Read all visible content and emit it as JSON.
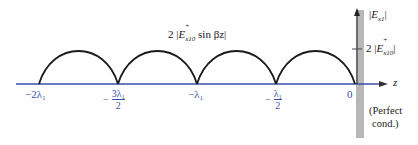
{
  "diagram": {
    "type": "standing-wave-field-magnitude",
    "curve_label": {
      "prefix": "2 |",
      "symbol": "E",
      "sub": "x10",
      "sup": "+",
      "suffix": " sin βz|"
    },
    "y_axis": {
      "label_prefix": "|",
      "symbol": "E",
      "sub": "x1",
      "label_suffix": "|",
      "tick_label": {
        "prefix": "2 |",
        "symbol": "E",
        "sub": "x10",
        "sup": "+",
        "suffix": "|"
      }
    },
    "x_axis": {
      "label": "z",
      "ticks": [
        {
          "label": "−2λ₁",
          "position": -1.0
        },
        {
          "minus": "−",
          "num": "3λ₁",
          "den": "2",
          "position": -0.75
        },
        {
          "label": "−λ₁",
          "position": -0.5
        },
        {
          "minus": "−",
          "num": "λ₁",
          "den": "2",
          "position": -0.25
        },
        {
          "label": "0",
          "position": 0
        }
      ]
    },
    "wall_label_line1": "(Perfect",
    "wall_label_line2": "cond.)",
    "colors": {
      "axis": "#3a4fa8",
      "curve": "#1a1a1a",
      "wall": "#b8b8b8"
    }
  }
}
